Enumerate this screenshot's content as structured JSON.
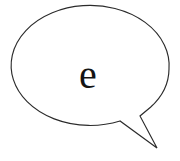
{
  "canvas": {
    "width": 180,
    "height": 161,
    "background_color": "#ffffff"
  },
  "balloon": {
    "shape": "speech-balloon-ellipse-with-tail",
    "stroke_color": "#2b2b2b",
    "fill_color": "#ffffff",
    "stroke_width": 1.15,
    "ellipse": {
      "center_x": 90,
      "center_y": 69,
      "radius_x": 79,
      "radius_y": 60
    },
    "tail": {
      "notch_x": 140,
      "notch_y": 116,
      "tip_x": 157,
      "tip_y": 148,
      "base_x": 120,
      "base_y": 121
    },
    "path": "M 169.0 69.0 A 79 60 0 0 1 150.5 107.3 L 140.0 116.0 L 157.0 148.0 L 120.0 121.0 A 79 60 0 1 1 169.0 69.0 Z"
  },
  "content": {
    "letter": "e",
    "letter_color": "#141414",
    "letter_font_size": 40,
    "letter_x": 88,
    "letter_y": 88
  }
}
